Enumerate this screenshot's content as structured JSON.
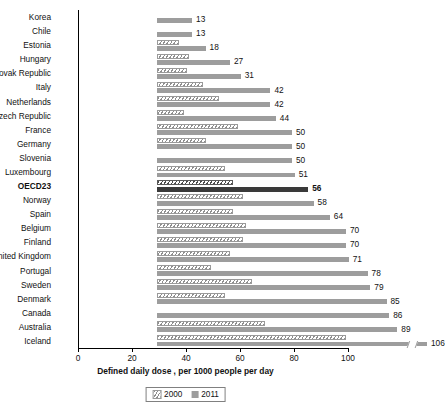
{
  "chart_data": {
    "type": "bar",
    "orientation": "horizontal",
    "title": "",
    "xlabel": "Defined daily dose , per 1000 people per day",
    "ylabel": "",
    "xlim": [
      0,
      100
    ],
    "xticks": [
      0,
      20,
      40,
      60,
      80,
      100
    ],
    "grid": false,
    "legend_position": "bottom-center",
    "categories": [
      "Korea",
      "Chile",
      "Estonia",
      "Hungary",
      "Slovak Republic",
      "Italy",
      "Netherlands",
      "Czech Republic",
      "France",
      "Germany",
      "Slovenia",
      "Luxembourg",
      "OECD23",
      "Norway",
      "Spain",
      "Belgium",
      "Finland",
      "United Kingdom",
      "Portugal",
      "Sweden",
      "Denmark",
      "Canada",
      "Australia",
      "Iceland"
    ],
    "highlight_category": "OECD23",
    "series": [
      {
        "name": "2000",
        "style": "hatched",
        "color": "#8e8e8e",
        "values": [
          0,
          0,
          8,
          12,
          11,
          17,
          23,
          10,
          30,
          18,
          0,
          25,
          28,
          32,
          28,
          33,
          32,
          27,
          20,
          35,
          25,
          0,
          40,
          70
        ]
      },
      {
        "name": "2011",
        "style": "solid",
        "color": "#9d9d9d",
        "values": [
          13,
          13,
          18,
          27,
          31,
          42,
          42,
          44,
          50,
          50,
          50,
          51,
          56,
          58,
          64,
          70,
          70,
          71,
          78,
          79,
          85,
          86,
          89,
          106
        ]
      }
    ],
    "value_labels": [
      "13",
      "13",
      "18",
      "27",
      "31",
      "42",
      "42",
      "44",
      "50",
      "50",
      "50",
      "51",
      "56",
      "58",
      "64",
      "70",
      "70",
      "71",
      "78",
      "79",
      "85",
      "86",
      "89",
      "106"
    ],
    "axis_break": {
      "category": "Iceland",
      "note": "bar truncated with break mark",
      "value": 106
    }
  },
  "legend": {
    "items": [
      {
        "label": "2000",
        "swatch": "hatched-swatch"
      },
      {
        "label": "2011",
        "swatch": "solid-swatch"
      }
    ]
  }
}
